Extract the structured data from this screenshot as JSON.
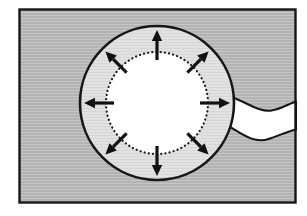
{
  "diagram": {
    "canvas": {
      "width": 307,
      "height": 216
    },
    "colors": {
      "page_background": "#ffffff",
      "outline": "#161616",
      "background_fill": "#b3b3b3",
      "background_line": "#c6c6c6",
      "wall_fill": "#e2e2e2",
      "wall_line": "#d6d6d6",
      "lumen_fill": "#ffffff",
      "tube_fill": "#ffffff",
      "arrow_color": "#111111"
    },
    "frame": {
      "x": 19.5,
      "y": 9.5,
      "width": 276,
      "height": 193,
      "stroke_width": 2.4
    },
    "outer_circle": {
      "cx": 157,
      "cy": 103,
      "r": 77,
      "stroke_width": 2.6
    },
    "inner_circle": {
      "cx": 157,
      "cy": 103,
      "r": 51,
      "stroke_width": 2.2,
      "dot_gap": 4.1
    },
    "arrows": {
      "angles_deg": [
        0,
        45,
        90,
        135,
        180,
        225,
        270,
        315
      ],
      "shaft_start_r": 43,
      "shaft_end_r": 62,
      "tip_r": 73,
      "shaft_width": 3.2,
      "head_half_width": 5.2
    },
    "tube": {
      "path": "M 224,94 C 248,102.5 259,112.5 271.5,110.5 C 281,109 289.5,103.5 296,101.5 L 296,129.5 C 287.5,131.5 279,135.5 268.5,139 C 252,144.5 238,130.5 224,123.5 Z",
      "stroke_width": 2
    }
  }
}
